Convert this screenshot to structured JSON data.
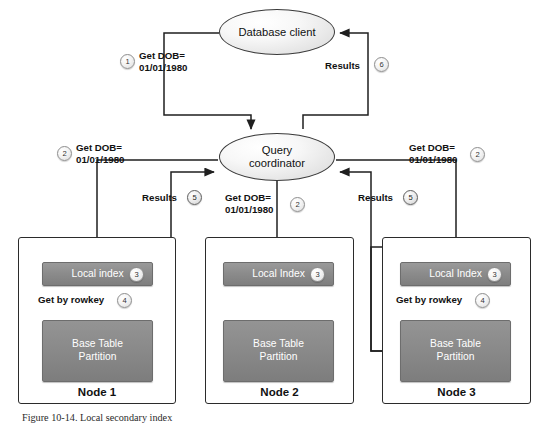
{
  "figure": {
    "caption": "Figure 10-14. Local secondary index"
  },
  "nodes": {
    "database_client": {
      "label": "Database client"
    },
    "query_coordinator": {
      "label_line1": "Query",
      "label_line2": "coordinator"
    },
    "node1": {
      "title": "Node 1",
      "index_label": "Local index",
      "index_badge": "3",
      "table_label_line1": "Base Table",
      "table_label_line2": "Partition",
      "rowkey_label": "Get by rowkey",
      "rowkey_badge": "4"
    },
    "node2": {
      "title": "Node 2",
      "index_label": "Local Index",
      "index_badge": "3",
      "table_label_line1": "Base Table",
      "table_label_line2": "Partition"
    },
    "node3": {
      "title": "Node 3",
      "index_label": "Local Index",
      "index_badge": "3",
      "table_label_line1": "Base Table",
      "table_label_line2": "Partition",
      "rowkey_label": "Get by rowkey",
      "rowkey_badge": "4"
    }
  },
  "edges": {
    "client_to_coordinator": {
      "badge": "1",
      "text_line1": "Get DOB=",
      "text_line2": "01/01/1980"
    },
    "coordinator_to_client": {
      "badge": "6",
      "text": "Results"
    },
    "coordinator_to_node1": {
      "badge": "2",
      "text_line1": "Get DOB=",
      "text_line2": "01/01/1980"
    },
    "coordinator_to_node2": {
      "badge": "2",
      "text_line1": "Get DOB=",
      "text_line2": "01/01/1980"
    },
    "coordinator_to_node3": {
      "badge": "2",
      "text_line1": "Get DOB=",
      "text_line2": "01/01/1980"
    },
    "node1_results": {
      "badge": "5",
      "text": "Results"
    },
    "node3_results": {
      "badge": "5",
      "text": "Results"
    }
  },
  "colors": {
    "box_gray": "#8a8a8a",
    "stroke": "#2b2b2b",
    "ellipse_fill": "#efefef",
    "text_on_box": "#ffffff"
  }
}
